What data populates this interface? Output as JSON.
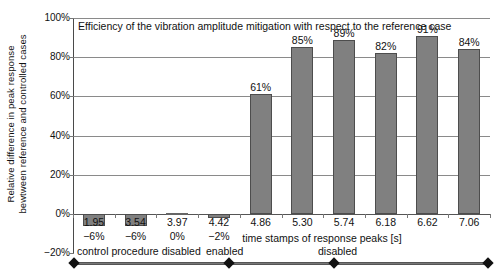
{
  "chart_data": {
    "type": "bar",
    "title": "Efficiency of the vibration amplitude mitigation with respect to the reference case",
    "xlabel": "time stamps of response peaks [s]",
    "ylabel_line1": "Relative difference in peak response",
    "ylabel_line2": "bewtween reference and controlled cases",
    "categories": [
      "1.95",
      "3.54",
      "3.97",
      "4.42",
      "4.86",
      "5.30",
      "5.74",
      "6.18",
      "6.62",
      "7.06"
    ],
    "values": [
      -6,
      -6,
      0,
      -2,
      61,
      85,
      89,
      82,
      91,
      84
    ],
    "data_labels": [
      "−6%",
      "−6%",
      "0%",
      "−2%",
      "61%",
      "85%",
      "89%",
      "82%",
      "91%",
      "84%"
    ],
    "ylim": [
      -20,
      100
    ],
    "yticks": [
      100,
      80,
      60,
      40,
      20,
      0,
      -20
    ],
    "ytick_labels": [
      "100%",
      "80%",
      "60%",
      "40%",
      "20%",
      "0%",
      "−20%"
    ],
    "grid": true,
    "legend": "none",
    "bar_color": "#808080",
    "bar_border_color": "#4d4d4d",
    "grid_color": "#8a8a8a",
    "annotations": [
      {
        "label": "control procedure disabled",
        "start_category": "1.95",
        "end_category": "4.42"
      },
      {
        "label": "enabled",
        "start_category": "4.42",
        "end_category": "5.74"
      },
      {
        "label": "disabled",
        "start_category": "5.74",
        "end_category": "7.06"
      }
    ]
  },
  "axis": {
    "y_title_line1": "Relative difference in peak response",
    "y_title_line2": "bewtween reference and controlled cases",
    "x_title": "time stamps of response peaks [s]"
  },
  "phases": {
    "first": "control procedure disabled",
    "second": "enabled",
    "third": "disabled"
  }
}
